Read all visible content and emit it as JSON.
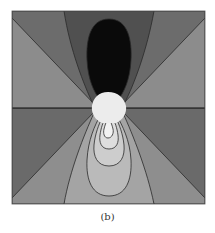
{
  "figure": {
    "caption": "(b)",
    "colors": {
      "black_lobe": "#0a0a0a",
      "dark_gray": "#505050",
      "medium_dark_gray": "#6c6c6c",
      "medium_gray": "#8c8c8c",
      "side_lower_gray": "#6a6a6a",
      "lower_wedge_gray": "#8e8e8e",
      "lower_lobe_1": "#a4a4a4",
      "lower_lobe_2": "#bababa",
      "lower_lobe_3": "#cdcdcd",
      "lower_lobe_4": "#dedede",
      "center_white": "#ececec",
      "contour_line": "#2a2a2a"
    }
  }
}
